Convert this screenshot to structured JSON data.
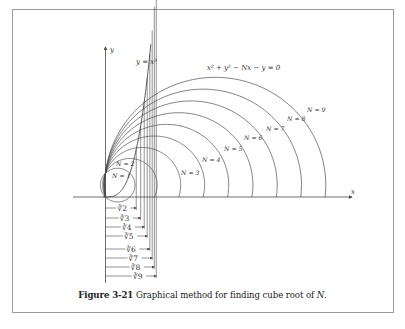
{
  "figure": {
    "caption_number": "Figure 3-21",
    "caption_text": " Graphical method for finding cube root of ",
    "caption_var": "N",
    "caption_end": "."
  },
  "labels": {
    "y_axis": "y",
    "x_axis": "x",
    "cubic_curve": "y = x³",
    "circle_family": "x² + y² − Nx − y = 0"
  },
  "colors": {
    "line": "#4a4a4a",
    "frame": "#9a9a9a",
    "text": "#333333"
  },
  "chart_data": {
    "type": "diagram",
    "title": "Graphical method for finding cube root of N",
    "curves": [
      {
        "name": "y = x^3",
        "kind": "cubic"
      },
      {
        "name": "x^2 + y^2 - Nx - y = 0",
        "kind": "circle_family",
        "N": [
          1,
          2,
          3,
          4,
          5,
          6,
          7,
          8,
          9
        ]
      }
    ],
    "circle_labels": [
      "N = 1",
      "N = 2",
      "N = 3",
      "N = 4",
      "N = 5",
      "N = 6",
      "N = 7",
      "N = 8",
      "N = 9"
    ],
    "cube_roots": [
      {
        "label": "∛2",
        "N": 2,
        "value": 1.26
      },
      {
        "label": "∛3",
        "N": 3,
        "value": 1.442
      },
      {
        "label": "∛4",
        "N": 4,
        "value": 1.587
      },
      {
        "label": "∛5",
        "N": 5,
        "value": 1.71
      },
      {
        "label": "∛6",
        "N": 6,
        "value": 1.817
      },
      {
        "label": "∛7",
        "N": 7,
        "value": 1.913
      },
      {
        "label": "∛8",
        "N": 8,
        "value": 2.0
      },
      {
        "label": "∛9",
        "N": 9,
        "value": 2.08
      }
    ],
    "xlabel": "x",
    "ylabel": "y"
  }
}
